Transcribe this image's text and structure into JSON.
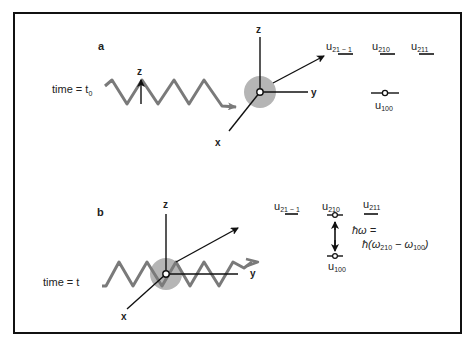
{
  "figure": {
    "colors": {
      "frame": "#111111",
      "wave": "#7a7a7a",
      "atom_cloud": "#b5b5b5",
      "axes": "#111111",
      "text": "#222222"
    },
    "panel_a": {
      "label": "a",
      "time_label": "time = t",
      "time_subscript": "0",
      "field_axis_label": "z",
      "axes": {
        "z": "z",
        "y": "y",
        "x": "x"
      },
      "levels": {
        "u21m1": {
          "base": "u",
          "sub": "21 − 1"
        },
        "u210": {
          "base": "u",
          "sub": "210"
        },
        "u211": {
          "base": "u",
          "sub": "211"
        },
        "u100": {
          "base": "u",
          "sub": "100"
        }
      },
      "occupied_level": "u100"
    },
    "panel_b": {
      "label": "b",
      "time_label": "time = t",
      "axes": {
        "z": "z",
        "y": "y",
        "x": "x"
      },
      "levels": {
        "u21m1": {
          "base": "u",
          "sub": "21 − 1"
        },
        "u210": {
          "base": "u",
          "sub": "210"
        },
        "u211": {
          "base": "u",
          "sub": "211"
        },
        "u100": {
          "base": "u",
          "sub": "100"
        }
      },
      "transition": {
        "from": "u100",
        "to": "u210",
        "energy_lhs": "ħω =",
        "energy_rhs_prefix": "ħ(ω",
        "energy_rhs_sub1": "210",
        "energy_rhs_mid": " − ω",
        "energy_rhs_sub2": "100",
        "energy_rhs_suffix": ")"
      }
    }
  }
}
